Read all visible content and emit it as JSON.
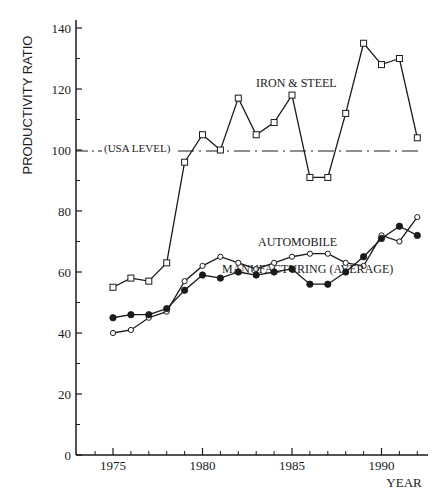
{
  "chart_data": {
    "type": "line",
    "title": "",
    "xlabel": "YEAR",
    "ylabel": "PRODUCTIVITY RATIO",
    "xlim": [
      1973,
      1992.8
    ],
    "ylim": [
      0,
      140
    ],
    "x_ticks_major": [
      1975,
      1980,
      1985,
      1990
    ],
    "x_ticks_minor": [
      1974,
      1976,
      1977,
      1978,
      1979,
      1981,
      1982,
      1983,
      1984,
      1986,
      1987,
      1988,
      1989,
      1991,
      1992
    ],
    "y_ticks_major": [
      0,
      20,
      40,
      60,
      80,
      100,
      120,
      140
    ],
    "y_ticks_minor": [
      10,
      30,
      50,
      70,
      90,
      110,
      130
    ],
    "grid": false,
    "legend": "inline labels",
    "x": [
      1975,
      1976,
      1977,
      1978,
      1979,
      1980,
      1981,
      1982,
      1983,
      1984,
      1985,
      1986,
      1987,
      1988,
      1989,
      1990,
      1991,
      1992
    ],
    "series": [
      {
        "name": "IRON & STEEL",
        "marker": "open-square",
        "values": [
          55,
          58,
          57,
          63,
          96,
          105,
          100,
          117,
          105,
          109,
          118,
          91,
          91,
          112,
          135,
          128,
          130,
          104
        ]
      },
      {
        "name": "AUTOMOBILE",
        "marker": "open-circle",
        "values": [
          40,
          41,
          45,
          47,
          57,
          62,
          65,
          63,
          61,
          63,
          65,
          66,
          66,
          63,
          62,
          72,
          70,
          78
        ]
      },
      {
        "name": "MANUFACTURING (AVERAGE)",
        "marker": "filled-circle",
        "values": [
          45,
          46,
          46,
          48,
          54,
          59,
          58,
          60,
          59,
          60,
          61,
          56,
          56,
          60,
          65,
          71,
          75,
          72
        ]
      }
    ],
    "reference_lines": [
      {
        "label": "(USA LEVEL)",
        "y": 100,
        "style": "dash-dot"
      }
    ],
    "annotations": [
      {
        "text": "IRON & STEEL",
        "x": 1986,
        "y": 123
      },
      {
        "text": "AUTOMOBILE",
        "x": 1986,
        "y": 70
      },
      {
        "text": "MANUFACTURING (AVERAGE)",
        "x": 1986,
        "y": 61
      }
    ]
  },
  "labels": {
    "ylabel": "PRODUCTIVITY RATIO",
    "xlabel": "YEAR",
    "usa_level": "(USA LEVEL)",
    "iron_steel": "IRON & STEEL",
    "automobile": "AUTOMOBILE",
    "manufacturing": "MANUFACTURING (AVERAGE)"
  },
  "colors": {
    "ink": "#1a1a1a",
    "background": "#ffffff"
  }
}
